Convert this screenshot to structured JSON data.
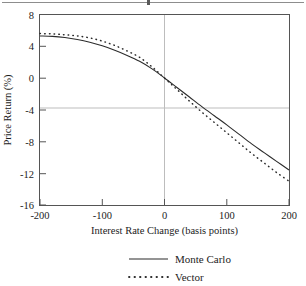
{
  "figure": {
    "top_rule": "horizontal-rule",
    "background_color": "#ffffff",
    "frame_color": "#555555"
  },
  "chart_data": {
    "type": "line",
    "title": "",
    "xlabel": "Interest Rate Change (basis points)",
    "ylabel": "Price Return (%)",
    "xlim": [
      -200,
      200
    ],
    "ylim": [
      -16,
      8
    ],
    "xticks": [
      -200,
      -100,
      0,
      100,
      200
    ],
    "xticklabels": [
      "-200",
      "-100",
      "0",
      "100",
      "200"
    ],
    "yticks": [
      -16,
      -12,
      -8,
      -4,
      0,
      4,
      8
    ],
    "yticklabels": [
      "-16",
      "-12",
      "-8",
      "-4",
      "0",
      "4",
      "8"
    ],
    "grid": false,
    "zero_line": true,
    "legend_position": "below",
    "x": [
      -200,
      -180,
      -160,
      -140,
      -120,
      -100,
      -80,
      -60,
      -40,
      -20,
      0,
      20,
      40,
      60,
      80,
      100,
      120,
      140,
      160,
      180,
      200
    ],
    "series": [
      {
        "name": "Monte Carlo",
        "style": "solid",
        "color": "#2b2b2b",
        "values": [
          5.3,
          5.25,
          5.1,
          4.85,
          4.5,
          4.05,
          3.5,
          2.85,
          2.1,
          1.15,
          0.0,
          -1.2,
          -2.4,
          -3.6,
          -4.75,
          -5.9,
          -7.1,
          -8.3,
          -9.4,
          -10.5,
          -11.6
        ]
      },
      {
        "name": "Vector",
        "style": "dotted",
        "color": "#2b2b2b",
        "values": [
          5.6,
          5.55,
          5.45,
          5.3,
          5.05,
          4.65,
          4.1,
          3.4,
          2.6,
          1.4,
          0.0,
          -1.45,
          -2.9,
          -4.3,
          -5.6,
          -6.9,
          -8.2,
          -9.5,
          -10.7,
          -11.9,
          -13.0
        ]
      }
    ]
  },
  "legend": {
    "items": [
      {
        "label": "Monte Carlo",
        "style": "solid"
      },
      {
        "label": "Vector",
        "style": "dotted"
      }
    ]
  }
}
